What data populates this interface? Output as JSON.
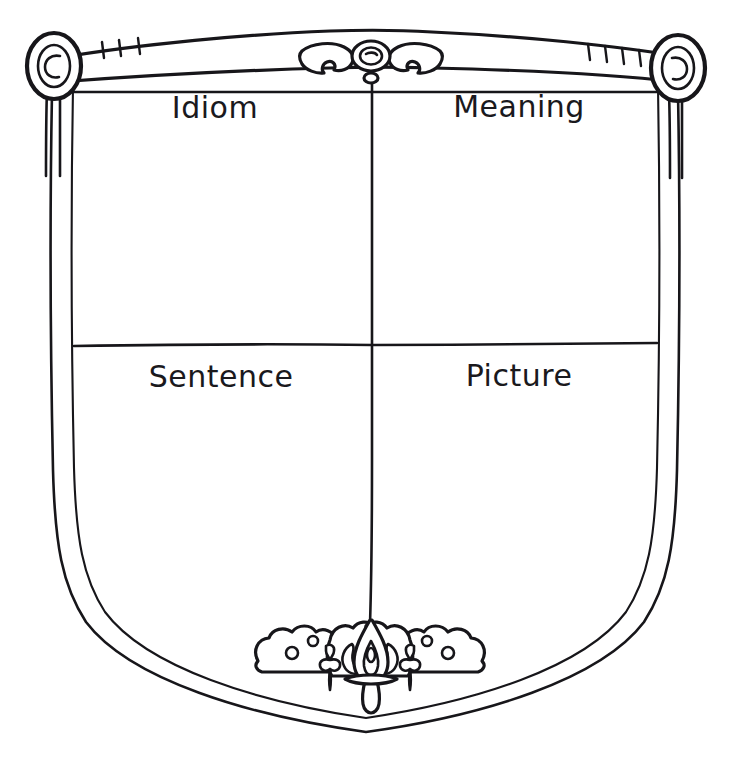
{
  "worksheet": {
    "title": "Idiom Shield Graphic Organizer",
    "background_color": "#ffffff",
    "ink_color": "#17161a",
    "width": 730,
    "height": 764
  },
  "banner": {
    "name": "scroll-banner",
    "left_finial_icon": "spiral-scroll-end-left-icon",
    "right_finial_icon": "spiral-scroll-end-right-icon",
    "center_ornament_icon": "winged-medallion-ornament-icon",
    "left_tick_count": 3,
    "right_tick_count": 4
  },
  "shield": {
    "name": "shield-outline",
    "divider_vertical": "vertical-divider",
    "divider_horizontal": "horizontal-divider",
    "bottom_ornament_icon": "fleur-de-lis-ornament-icon"
  },
  "quadrants": [
    {
      "id": "idiom",
      "label": "Idiom",
      "position": "top-left"
    },
    {
      "id": "meaning",
      "label": "Meaning",
      "position": "top-right"
    },
    {
      "id": "sentence",
      "label": "Sentence",
      "position": "bottom-left"
    },
    {
      "id": "picture",
      "label": "Picture",
      "position": "bottom-right"
    }
  ]
}
